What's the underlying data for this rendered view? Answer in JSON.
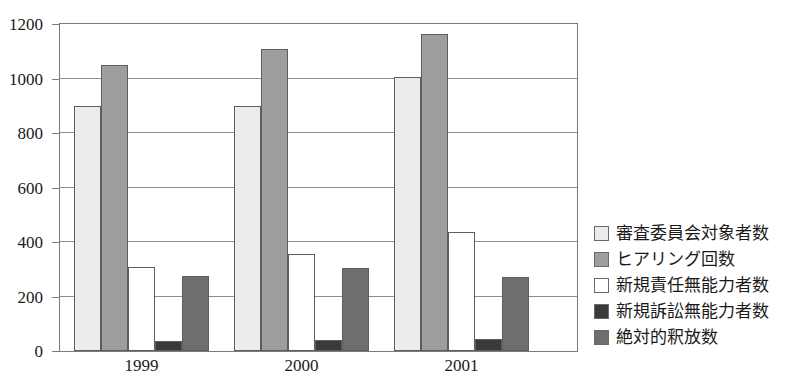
{
  "chart_data": {
    "type": "bar",
    "title": "",
    "xlabel": "",
    "ylabel": "",
    "ylim": [
      0,
      1200
    ],
    "ytick_step": 200,
    "grid": true,
    "legend_position": "right",
    "categories": [
      "1999",
      "2000",
      "2001"
    ],
    "series": [
      {
        "name": "審査委員会対象者数",
        "color": "#ececec",
        "values": [
          900,
          900,
          1005
        ]
      },
      {
        "name": "ヒアリング回数",
        "color": "#9e9e9e",
        "values": [
          1050,
          1110,
          1165
        ]
      },
      {
        "name": "新規責任無能力者数",
        "color": "#ffffff",
        "values": [
          310,
          355,
          435
        ]
      },
      {
        "name": "新規訴訟無能力者数",
        "color": "#3a3a3a",
        "values": [
          35,
          40,
          45
        ]
      },
      {
        "name": "絶対的釈放数",
        "color": "#6e6e6e",
        "values": [
          275,
          305,
          270
        ]
      }
    ],
    "ytick_labels": [
      "0",
      "200",
      "400",
      "600",
      "800",
      "1000",
      "1200"
    ],
    "ytick_values": [
      0,
      200,
      400,
      600,
      800,
      1000,
      1200
    ]
  },
  "axis_color": "#7b7b7b",
  "grid_color": "#8d8d8d"
}
